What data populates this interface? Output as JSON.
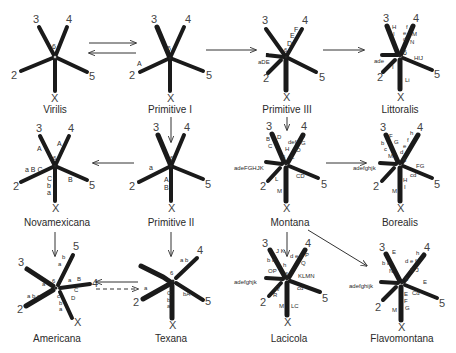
{
  "figure": {
    "karyotypes": [
      {
        "id": "virilis",
        "name": "Virilis",
        "arm_labels": {
          "2": "2",
          "3": "3",
          "4": "4",
          "5": "5",
          "X": "X",
          "6": "6"
        },
        "inversions": []
      },
      {
        "id": "primitive1",
        "name": "Primitive I",
        "arm_labels": {
          "2": "2",
          "3": "3",
          "4": "4",
          "5": "5",
          "X": "X",
          "6": "6"
        },
        "inversions": [
          "A"
        ]
      },
      {
        "id": "primitive3",
        "name": "Primitive III",
        "arm_labels": {
          "2": "2",
          "3": "3",
          "4": "4",
          "5": "5",
          "X": "X",
          "6": "6"
        },
        "inversions": [
          "aDE",
          "D",
          "E",
          "F"
        ]
      },
      {
        "id": "littoralis",
        "name": "Littoralis",
        "arm_labels": {
          "2": "2",
          "3": "3",
          "4": "4",
          "5": "5",
          "X": "X",
          "6": "6"
        },
        "inversions": [
          "ade",
          "I",
          "H",
          "I",
          "e",
          "d",
          "f",
          "M",
          "N",
          "HIJ",
          "Li"
        ]
      },
      {
        "id": "novamexicana",
        "name": "Novamexicana",
        "arm_labels": {
          "2": "2",
          "3": "3",
          "4": "4",
          "5": "5",
          "X": "X",
          "6": "6"
        },
        "inversions": [
          "A",
          "A",
          "aBC",
          "B",
          "C",
          "b",
          "a"
        ]
      },
      {
        "id": "primitive2",
        "name": "Primitive II",
        "arm_labels": {
          "2": "2",
          "3": "3",
          "4": "4",
          "5": "5",
          "X": "X",
          "6": "6"
        },
        "inversions": [
          "a",
          "A",
          "B"
        ]
      },
      {
        "id": "montana",
        "name": "Montana",
        "arm_labels": {
          "2": "2",
          "3": "3",
          "4": "4",
          "5": "5",
          "X": "X",
          "6": "6"
        },
        "inversions": [
          "B",
          "C",
          "D",
          "def",
          "H",
          "I",
          "G",
          "O",
          "L",
          "adeFGHJK",
          "L",
          "CD",
          "M"
        ]
      },
      {
        "id": "borealis",
        "name": "Borealis",
        "arm_labels": {
          "2": "2",
          "3": "3",
          "4": "4",
          "5": "5",
          "X": "X",
          "6": "6"
        },
        "inversions": [
          "F",
          "G",
          "bc",
          "M",
          "h",
          "f",
          "e",
          "d",
          "adefghjk",
          "FG",
          "cd",
          "H",
          "I",
          "M"
        ]
      },
      {
        "id": "americana",
        "name": "Americana",
        "arm_labels": {
          "2": "2",
          "3": "3",
          "4": "4",
          "5": "5",
          "X": "X",
          "6": "6"
        },
        "inversions": [
          "a",
          "abc",
          "b",
          "a",
          "a",
          "B",
          "C",
          "c",
          "b",
          "a",
          "D"
        ]
      },
      {
        "id": "texana",
        "name": "Texana",
        "arm_labels": {
          "2": "2",
          "4": "4",
          "5": "5",
          "X": "X",
          "6": "6"
        },
        "inversions": [
          "a",
          "ab",
          "C",
          "b",
          "a",
          "bA"
        ]
      },
      {
        "id": "lacicola",
        "name": "Lacicola",
        "arm_labels": {
          "2": "2",
          "3": "3",
          "4": "4",
          "5": "5",
          "X": "X",
          "6": "6"
        },
        "inversions": [
          "JK",
          "bc",
          "h",
          "def",
          "P",
          "Q",
          "OP",
          "adefghjk",
          "Q",
          "R",
          "KLMN",
          "cd",
          "M",
          "LC"
        ]
      },
      {
        "id": "flavomontana",
        "name": "Flavomontana",
        "arm_labels": {
          "2": "2",
          "3": "3",
          "4": "4",
          "5": "5",
          "X": "X",
          "6": "6"
        },
        "inversions": [
          "E",
          "bc",
          "N",
          "def",
          "h",
          "KJ",
          "adefghijk",
          "E",
          "Cd",
          "E",
          "F",
          "G",
          "M"
        ]
      }
    ],
    "relationships": [
      {
        "from": "virilis",
        "to": "primitive1",
        "type": "bidirectional"
      },
      {
        "from": "primitive1",
        "to": "primitive3",
        "type": "directed"
      },
      {
        "from": "primitive3",
        "to": "littoralis",
        "type": "directed"
      },
      {
        "from": "primitive1",
        "to": "primitive2",
        "type": "directed"
      },
      {
        "from": "primitive2",
        "to": "novamexicana",
        "type": "directed"
      },
      {
        "from": "primitive3",
        "to": "montana",
        "type": "directed"
      },
      {
        "from": "montana",
        "to": "borealis",
        "type": "directed"
      },
      {
        "from": "novamexicana",
        "to": "americana",
        "type": "directed"
      },
      {
        "from": "primitive2",
        "to": "texana",
        "type": "directed"
      },
      {
        "from": "texana",
        "to": "americana",
        "type": "solid-left"
      },
      {
        "from": "americana",
        "to": "texana",
        "type": "dashed-right"
      },
      {
        "from": "montana",
        "to": "lacicola",
        "type": "directed"
      },
      {
        "from": "montana",
        "to": "flavomontana",
        "type": "directed"
      }
    ]
  },
  "labels": {
    "virilis": "Virilis",
    "primitive1": "Primitive I",
    "primitive3": "Primitive III",
    "littoralis": "Littoralis",
    "novamexicana": "Novamexicana",
    "primitive2": "Primitive II",
    "montana": "Montana",
    "borealis": "Borealis",
    "americana": "Americana",
    "texana": "Texana",
    "lacicola": "Lacicola",
    "flavomontana": "Flavomontana"
  },
  "arms": {
    "n2": "2",
    "n3": "3",
    "n4": "4",
    "n5": "5",
    "nX": "X",
    "n6": "6"
  },
  "ann": {
    "p1_A": "A",
    "p3_aDE": "aDE",
    "p3_D": "D",
    "p3_E": "E",
    "p3_F": "F",
    "li_H": "H",
    "li_I": "I",
    "li_f": "f",
    "li_e": "e",
    "li_d": "d",
    "li_M": "M",
    "li_N": "N",
    "li_ade": "ade",
    "li_I2": "I",
    "li_HIJ": "HIJ",
    "li_Li": "Li",
    "nv_A1": "A",
    "nv_A2": "A",
    "nv_aBC": "a B C",
    "nv_B": "B",
    "nv_C": "C",
    "nv_b": "b",
    "nv_a": "a",
    "p2_a": "a",
    "p2_A": "A",
    "p2_B": "B",
    "mo_B": "B",
    "mo_C": "C",
    "mo_D": "D",
    "mo_def": "def",
    "mo_H": "H",
    "mo_I": "I",
    "mo_G": "G",
    "mo_O": "O",
    "mo_L": "L",
    "mo_adeF": "adeFGHJK",
    "mo_L2": "L",
    "mo_CD": "CD",
    "mo_M": "M",
    "bo_F": "F",
    "bo_G": "G",
    "bo_b": "b",
    "bo_c": "c",
    "bo_M": "M",
    "bo_h": "h",
    "bo_f": "f",
    "bo_e": "e",
    "bo_d": "d",
    "bo_adef": "adefghjk",
    "bo_FG": "FG",
    "bo_cd": "cd",
    "bo_H": "H",
    "bo_I": "I",
    "bo_M2": "M",
    "am_a1": "a",
    "am_abc": "a b c",
    "am_b": "b",
    "am_a2": "a",
    "am_a3": "a",
    "am_B": "B",
    "am_C": "C",
    "am_c": "c",
    "am_b2": "b",
    "am_a4": "a",
    "am_D": "D",
    "tx_a": "a",
    "tx_ab": "a b",
    "tx_C": "C",
    "tx_b": "b",
    "tx_a2": "a",
    "tx_bA": "bA",
    "la_JK": "J K",
    "la_bc": "b c",
    "la_h": "h",
    "la_def": "d e f",
    "la_P": "P",
    "la_Q": "Q",
    "la_OP": "OP",
    "la_adef": "adefghjk",
    "la_Q2": "Q",
    "la_R": "R",
    "la_KLMN": "KLMN",
    "la_cd": "cd",
    "la_M": "M",
    "la_LC": "LC",
    "fl_E": "E",
    "fl_bc": "b c",
    "fl_N": "N",
    "fl_def": "d e f",
    "fl_h": "h",
    "fl_KJ": "K J",
    "fl_adef": "adefghijk",
    "fl_E2": "E",
    "fl_Cd": "Cd",
    "fl_E3": "E",
    "fl_F": "F",
    "fl_G": "G",
    "fl_M": "M"
  }
}
